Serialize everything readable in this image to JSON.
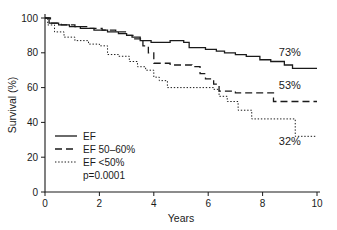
{
  "chart_data": {
    "type": "line",
    "title": "",
    "subtitle": "",
    "xlabel": "Years",
    "ylabel": "Survival (%)",
    "xlim": [
      0,
      10
    ],
    "ylim": [
      0,
      100
    ],
    "grid": false,
    "legend_position": "lower-left-inside",
    "x_ticks": [
      0,
      2,
      4,
      6,
      8,
      10
    ],
    "x_tick_labels": [
      "0",
      "2",
      "4",
      "6",
      "8",
      "10"
    ],
    "y_ticks": [
      0,
      20,
      40,
      60,
      80,
      100
    ],
    "y_tick_labels": [
      "0",
      "20",
      "40",
      "60",
      "80",
      "100"
    ],
    "series": [
      {
        "name": "EF",
        "style": "solid",
        "color": "#1a1a1a",
        "end_label": "73%",
        "points": [
          [
            0.0,
            100
          ],
          [
            0.15,
            100
          ],
          [
            0.15,
            97
          ],
          [
            0.5,
            97
          ],
          [
            0.5,
            96
          ],
          [
            0.9,
            96
          ],
          [
            0.9,
            95
          ],
          [
            1.3,
            95
          ],
          [
            1.3,
            94
          ],
          [
            1.8,
            94
          ],
          [
            1.8,
            93
          ],
          [
            2.3,
            93
          ],
          [
            2.3,
            92
          ],
          [
            2.7,
            92
          ],
          [
            2.7,
            91
          ],
          [
            3.0,
            91
          ],
          [
            3.0,
            90
          ],
          [
            3.2,
            90
          ],
          [
            3.2,
            89
          ],
          [
            3.5,
            89
          ],
          [
            3.5,
            87
          ],
          [
            3.9,
            87
          ],
          [
            3.9,
            86
          ],
          [
            4.6,
            86
          ],
          [
            4.6,
            87
          ],
          [
            5.1,
            87
          ],
          [
            5.1,
            86
          ],
          [
            5.3,
            86
          ],
          [
            5.3,
            83
          ],
          [
            5.9,
            83
          ],
          [
            5.9,
            82
          ],
          [
            6.3,
            82
          ],
          [
            6.3,
            81
          ],
          [
            6.6,
            81
          ],
          [
            6.6,
            80
          ],
          [
            7.0,
            80
          ],
          [
            7.0,
            79
          ],
          [
            7.4,
            79
          ],
          [
            7.4,
            78
          ],
          [
            7.9,
            78
          ],
          [
            7.9,
            76
          ],
          [
            8.3,
            76
          ],
          [
            8.3,
            75
          ],
          [
            8.8,
            75
          ],
          [
            8.8,
            73
          ],
          [
            9.1,
            73
          ],
          [
            9.1,
            71
          ],
          [
            10.0,
            71
          ]
        ]
      },
      {
        "name": "EF 50–60%",
        "style": "dashed",
        "color": "#1a1a1a",
        "end_label": "53%",
        "points": [
          [
            0.0,
            100
          ],
          [
            0.2,
            100
          ],
          [
            0.2,
            97
          ],
          [
            0.6,
            97
          ],
          [
            0.6,
            96
          ],
          [
            1.1,
            96
          ],
          [
            1.1,
            95
          ],
          [
            1.6,
            95
          ],
          [
            1.6,
            94
          ],
          [
            2.1,
            94
          ],
          [
            2.1,
            93
          ],
          [
            2.6,
            93
          ],
          [
            2.6,
            92
          ],
          [
            3.0,
            92
          ],
          [
            3.0,
            90
          ],
          [
            3.3,
            90
          ],
          [
            3.3,
            88
          ],
          [
            3.6,
            88
          ],
          [
            3.6,
            84
          ],
          [
            3.8,
            84
          ],
          [
            3.8,
            80
          ],
          [
            4.0,
            80
          ],
          [
            4.0,
            74
          ],
          [
            4.6,
            74
          ],
          [
            4.6,
            73
          ],
          [
            5.4,
            73
          ],
          [
            5.4,
            72
          ],
          [
            5.7,
            72
          ],
          [
            5.7,
            68
          ],
          [
            5.9,
            68
          ],
          [
            5.9,
            65
          ],
          [
            6.2,
            65
          ],
          [
            6.2,
            62
          ],
          [
            6.4,
            62
          ],
          [
            6.4,
            58
          ],
          [
            7.0,
            58
          ],
          [
            7.0,
            57
          ],
          [
            8.4,
            57
          ],
          [
            8.4,
            52
          ],
          [
            10.0,
            52
          ]
        ]
      },
      {
        "name": "EF <50%",
        "style": "dotted",
        "color": "#1a1a1a",
        "end_label": "32%",
        "points": [
          [
            0.0,
            100
          ],
          [
            0.1,
            100
          ],
          [
            0.1,
            96
          ],
          [
            0.35,
            96
          ],
          [
            0.35,
            92
          ],
          [
            0.7,
            92
          ],
          [
            0.7,
            89
          ],
          [
            1.1,
            89
          ],
          [
            1.1,
            87
          ],
          [
            1.6,
            87
          ],
          [
            1.6,
            85
          ],
          [
            2.0,
            85
          ],
          [
            2.0,
            84
          ],
          [
            2.3,
            84
          ],
          [
            2.3,
            79
          ],
          [
            2.7,
            79
          ],
          [
            2.7,
            78
          ],
          [
            3.1,
            78
          ],
          [
            3.1,
            75
          ],
          [
            3.4,
            75
          ],
          [
            3.4,
            72
          ],
          [
            3.7,
            72
          ],
          [
            3.7,
            70
          ],
          [
            4.0,
            70
          ],
          [
            4.0,
            66
          ],
          [
            4.2,
            66
          ],
          [
            4.2,
            64
          ],
          [
            4.5,
            64
          ],
          [
            4.5,
            60
          ],
          [
            6.2,
            60
          ],
          [
            6.2,
            59
          ],
          [
            6.4,
            59
          ],
          [
            6.4,
            55
          ],
          [
            6.7,
            55
          ],
          [
            6.7,
            52
          ],
          [
            7.1,
            52
          ],
          [
            7.1,
            47
          ],
          [
            7.6,
            47
          ],
          [
            7.6,
            42
          ],
          [
            9.2,
            42
          ],
          [
            9.2,
            32
          ],
          [
            10.0,
            32
          ]
        ]
      }
    ],
    "annotations": [
      {
        "text": "73%",
        "x": 9.0,
        "y": 78,
        "series": "EF"
      },
      {
        "text": "53%",
        "x": 9.0,
        "y": 59,
        "series": "EF 50–60%"
      },
      {
        "text": "32%",
        "x": 9.0,
        "y": 27,
        "series": "EF <50%"
      },
      {
        "text": "p=0.0001",
        "x": 1.0,
        "y": 26,
        "series": ""
      }
    ],
    "pvalue_text": "p=0.0001"
  },
  "legend": {
    "items": [
      {
        "label": "EF",
        "style": "solid"
      },
      {
        "label": "EF 50–60%",
        "style": "dashed"
      },
      {
        "label": "EF <50%",
        "style": "dotted"
      }
    ],
    "note": "p=0.0001"
  },
  "colors": {
    "ink": "#1a1a1a",
    "background": "#ffffff"
  }
}
